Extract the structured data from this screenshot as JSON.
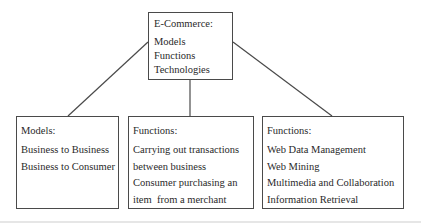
{
  "diagram": {
    "root": {
      "title": "E-Commerce:",
      "items": [
        "Models",
        "Functions",
        "Technologies"
      ]
    },
    "children": [
      {
        "title": "Models:",
        "items": [
          "Business to Business",
          "Business to Consumer"
        ]
      },
      {
        "title": "Functions:",
        "items": [
          "Carrying out transactions",
          "between business",
          "Consumer purchasing an",
          "item  from a merchant"
        ]
      },
      {
        "title": "Functions:",
        "items": [
          "Web Data Management",
          "Web Mining",
          "Multimedia and Collaboration",
          "Information Retrieval"
        ]
      }
    ],
    "edges": [
      {
        "from": "root",
        "to": "children.0"
      },
      {
        "from": "root",
        "to": "children.1"
      },
      {
        "from": "root",
        "to": "children.2"
      }
    ],
    "colors": {
      "stroke": "#4a4a4a",
      "text": "#2a2a2a",
      "background": "#ffffff"
    }
  }
}
